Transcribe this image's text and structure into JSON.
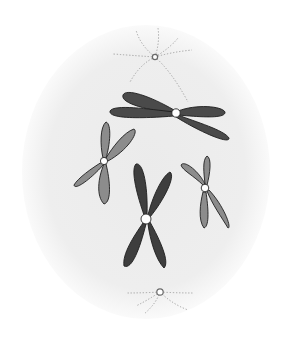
{
  "diagram": {
    "title": "",
    "subject": "Animal cell in prometaphase/metaphase with four duplicated chromosomes and two centrosomes",
    "colors": {
      "background": "#ffffff",
      "cell": "#ececec",
      "cell_edge": "#f7f7f7",
      "chromosome_dark": "#4a4a4a",
      "chromosome_light": "#8c8c8c",
      "centromere": "#ffffff",
      "aster": "#9a9a9a"
    },
    "cell": {
      "cx": 146,
      "cy": 172,
      "rx": 124,
      "ry": 147
    },
    "centrosomes": [
      {
        "name": "centrosome-top",
        "x": 155,
        "y": 57
      },
      {
        "name": "centrosome-bottom",
        "x": 160,
        "y": 292
      }
    ],
    "chromosomes": [
      {
        "name": "chromosome-large-dark",
        "shade": "dark",
        "centromere": [
          176,
          113
        ]
      },
      {
        "name": "chromosome-left-light",
        "shade": "light",
        "centromere": [
          104,
          161
        ]
      },
      {
        "name": "chromosome-center-dark",
        "shade": "dark",
        "centromere": [
          146,
          219
        ]
      },
      {
        "name": "chromosome-right-light",
        "shade": "light",
        "centromere": [
          205,
          188
        ]
      }
    ]
  }
}
